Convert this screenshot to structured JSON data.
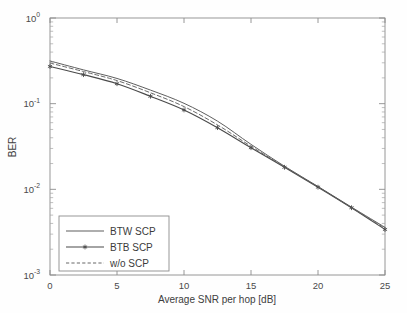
{
  "chart_data": {
    "type": "line",
    "title": "",
    "xlabel": "Average SNR per hop [dB]",
    "ylabel": "BER",
    "xlim": [
      0,
      25
    ],
    "ylim": [
      0.001,
      1
    ],
    "yscale": "log",
    "xscale": "linear",
    "grid": false,
    "legend_position": "lower-left",
    "xticks": [
      "0",
      "5",
      "10",
      "15",
      "20",
      "25"
    ],
    "xtick_values": [
      0,
      5,
      10,
      15,
      20,
      25
    ],
    "yticks": [
      "10",
      "10",
      "10",
      "10"
    ],
    "ytick_exponents": [
      "0",
      "-1",
      "-2",
      "-3"
    ],
    "ytick_values": [
      1,
      0.1,
      0.01,
      0.001
    ],
    "x": [
      0,
      2.5,
      5,
      7.5,
      10,
      12.5,
      15,
      17.5,
      20,
      22.5,
      25
    ],
    "series": [
      {
        "name": "BTW SCP",
        "style": "solid",
        "marker": "none",
        "color": "#555555",
        "values": [
          0.315,
          0.248,
          0.197,
          0.144,
          0.101,
          0.0625,
          0.0335,
          0.0186,
          0.0108,
          0.0062,
          0.0036
        ]
      },
      {
        "name": "BTB SCP",
        "style": "solid",
        "marker": "star",
        "color": "#4a4a4a",
        "values": [
          0.272,
          0.218,
          0.171,
          0.122,
          0.0845,
          0.0525,
          0.0306,
          0.0181,
          0.0106,
          0.0061,
          0.0034
        ]
      },
      {
        "name": "w/o SCP",
        "style": "dashed",
        "marker": "none",
        "color": "#606060",
        "values": [
          0.298,
          0.237,
          0.186,
          0.134,
          0.0925,
          0.0565,
          0.0318,
          0.0183,
          0.0107,
          0.0061,
          0.0035
        ]
      }
    ]
  },
  "legend": {
    "items": [
      {
        "label": "BTW SCP"
      },
      {
        "label": "BTB SCP"
      },
      {
        "label": "w/o SCP"
      }
    ]
  },
  "axes": {
    "x_title": "Average SNR per hop [dB]",
    "y_title": "BER"
  }
}
